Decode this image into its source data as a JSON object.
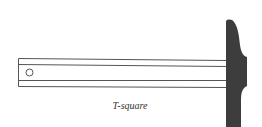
{
  "figure": {
    "caption": "T-square",
    "colors": {
      "line": "#555555",
      "head_fill": "#3d3d3d",
      "background": "#ffffff"
    },
    "components": [
      {
        "name": "blade",
        "description": "long straight ruler-like blade with two inner parallel lines"
      },
      {
        "name": "hang-hole",
        "description": "small circular hole near the left end of the blade"
      },
      {
        "name": "head",
        "description": "dark solid head at the right end, perpendicular to the blade"
      }
    ]
  }
}
